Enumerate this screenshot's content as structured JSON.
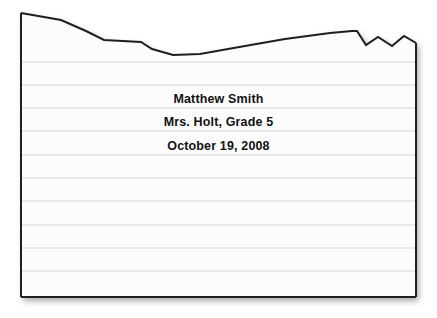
{
  "document": {
    "type": "torn-notebook-paper",
    "heading_lines": [
      {
        "id": "student-name",
        "text": "Matthew Smith"
      },
      {
        "id": "teacher-and-grade",
        "text": "Mrs. Holt, Grade 5"
      },
      {
        "id": "date",
        "text": "October 19, 2008"
      }
    ]
  },
  "colors": {
    "page_background": "#ffffff",
    "paper_fill": "#fcfcfc",
    "paper_border": "#1a1a1a",
    "rule_line": "#e2e2e2",
    "text": "#121212",
    "shadow": "#9a9a9a"
  },
  "geometry": {
    "paper_left": 21,
    "paper_right": 416,
    "paper_bottom": 297,
    "torn_top_path": "M21,13 L61,20 L86,31 L104,40 L141,42 L152,49 L173,55 L200,54 L245,46 L285,39 L330,33 L352,31 L357,31 L366,45 L378,37 L392,46 L404,36 L416,43",
    "rule_line_ys": [
      62,
      85,
      108,
      131,
      155,
      178,
      201,
      225,
      248,
      271
    ],
    "rule_line_spacing": 23.3
  }
}
